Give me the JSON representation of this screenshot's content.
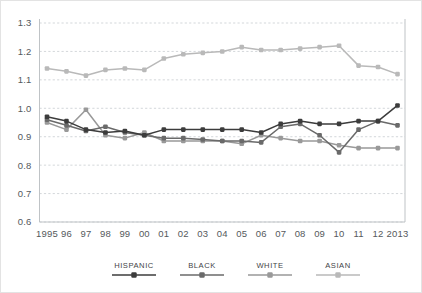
{
  "chart_data": {
    "type": "line",
    "title": "",
    "subtitle": "",
    "xlabel": "",
    "ylabel": "",
    "xlim": [
      1995,
      2013
    ],
    "ylim": [
      0.6,
      1.3
    ],
    "ytick_labels": [
      "1.3",
      "1.2",
      "1.1",
      "1.0",
      "0.9",
      "0.8",
      "0.7",
      "0.6"
    ],
    "ytick_values": [
      1.3,
      1.2,
      1.1,
      1.0,
      0.9,
      0.8,
      0.7,
      0.6
    ],
    "grid": "horizontal-dashed",
    "legend_position": "bottom",
    "categories": [
      1995,
      1996,
      1997,
      1998,
      1999,
      2000,
      2001,
      2002,
      2003,
      2004,
      2005,
      2006,
      2007,
      2008,
      2009,
      2010,
      2011,
      2012,
      2013
    ],
    "x": [
      "1995",
      "96",
      "97",
      "98",
      "99",
      "00",
      "01",
      "02",
      "03",
      "04",
      "05",
      "06",
      "07",
      "08",
      "09",
      "10",
      "11",
      "12",
      "2013"
    ],
    "series": [
      {
        "name": "HISPANIC",
        "color": "#3c3c3c",
        "values": [
          0.97,
          0.955,
          0.925,
          0.915,
          0.92,
          0.905,
          0.925,
          0.925,
          0.925,
          0.925,
          0.925,
          0.915,
          0.945,
          0.955,
          0.945,
          0.945,
          0.955,
          0.955,
          1.01
        ]
      },
      {
        "name": "BLACK",
        "color": "#6a6a6a",
        "values": [
          0.96,
          0.94,
          0.92,
          0.935,
          0.915,
          0.905,
          0.895,
          0.895,
          0.89,
          0.885,
          0.885,
          0.88,
          0.935,
          0.945,
          0.905,
          0.845,
          0.925,
          0.955,
          0.94
        ]
      },
      {
        "name": "WHITE",
        "color": "#999999",
        "values": [
          0.95,
          0.925,
          0.995,
          0.905,
          0.895,
          0.915,
          0.885,
          0.885,
          0.885,
          0.885,
          0.875,
          0.905,
          0.895,
          0.885,
          0.885,
          0.87,
          0.86,
          0.86,
          0.86
        ]
      },
      {
        "name": "ASIAN",
        "color": "#b9b9b9",
        "values": [
          1.14,
          1.13,
          1.115,
          1.135,
          1.14,
          1.135,
          1.175,
          1.19,
          1.195,
          1.2,
          1.215,
          1.205,
          1.205,
          1.21,
          1.215,
          1.22,
          1.15,
          1.145,
          1.12
        ]
      }
    ]
  },
  "legend": {
    "items": [
      {
        "label": "HISPANIC",
        "color": "#3c3c3c"
      },
      {
        "label": "BLACK",
        "color": "#6a6a6a"
      },
      {
        "label": "WHITE",
        "color": "#999999"
      },
      {
        "label": "ASIAN",
        "color": "#b9b9b9"
      }
    ]
  },
  "colors": {
    "gridline": "#c8cdd0",
    "axis": "#bfc3c6",
    "tick_text": "#55595c",
    "legend_text": "#3f4447",
    "background": "#ffffff",
    "border": "#e3e3e3"
  }
}
